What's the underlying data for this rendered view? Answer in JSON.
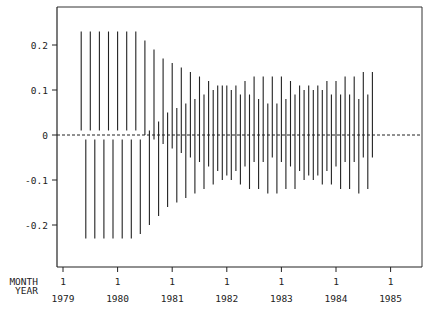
{
  "chart_data": {
    "type": "interval",
    "title": "",
    "xlabel": "",
    "ylabel": "",
    "ylim": [
      -0.28,
      0.28
    ],
    "yticks": [
      0.2,
      0.1,
      0,
      -0.1,
      -0.2
    ],
    "ytick_labels": [
      "0.2",
      "0.1",
      "0",
      "-0.1",
      "-0.2"
    ],
    "x_axis_rows": [
      {
        "label": "MONTH",
        "values": [
          "1",
          "1",
          "1",
          "1",
          "1",
          "1",
          "1"
        ]
      },
      {
        "label": "YEAR",
        "values": [
          "1979",
          "1980",
          "1981",
          "1982",
          "1983",
          "1984",
          "1985"
        ]
      }
    ],
    "reference_line": {
      "y": 0,
      "style": "dashed"
    },
    "grid": false,
    "start_month_index": 4,
    "intervals": [
      [
        0.01,
        0.23
      ],
      [
        -0.23,
        -0.01
      ],
      [
        0.01,
        0.23
      ],
      [
        -0.23,
        -0.01
      ],
      [
        0.01,
        0.23
      ],
      [
        -0.23,
        -0.01
      ],
      [
        0.01,
        0.23
      ],
      [
        -0.23,
        -0.01
      ],
      [
        0.01,
        0.23
      ],
      [
        -0.23,
        -0.01
      ],
      [
        0.01,
        0.23
      ],
      [
        -0.23,
        -0.01
      ],
      [
        0.01,
        0.23
      ],
      [
        -0.22,
        -0.01
      ],
      [
        0.0,
        0.21
      ],
      [
        -0.2,
        0.01
      ],
      [
        -0.01,
        0.19
      ],
      [
        -0.18,
        0.03
      ],
      [
        -0.02,
        0.17
      ],
      [
        -0.16,
        0.05
      ],
      [
        -0.03,
        0.16
      ],
      [
        -0.15,
        0.06
      ],
      [
        -0.04,
        0.15
      ],
      [
        -0.14,
        0.07
      ],
      [
        -0.05,
        0.14
      ],
      [
        -0.13,
        0.08
      ],
      [
        -0.06,
        0.13
      ],
      [
        -0.12,
        0.09
      ],
      [
        -0.07,
        0.12
      ],
      [
        -0.11,
        0.1
      ],
      [
        -0.08,
        0.11
      ],
      [
        -0.1,
        0.11
      ],
      [
        -0.09,
        0.11
      ],
      [
        -0.1,
        0.1
      ],
      [
        -0.08,
        0.11
      ],
      [
        -0.11,
        0.09
      ],
      [
        -0.07,
        0.12
      ],
      [
        -0.12,
        0.09
      ],
      [
        -0.06,
        0.13
      ],
      [
        -0.12,
        0.08
      ],
      [
        -0.06,
        0.13
      ],
      [
        -0.13,
        0.07
      ],
      [
        -0.05,
        0.13
      ],
      [
        -0.13,
        0.07
      ],
      [
        -0.06,
        0.13
      ],
      [
        -0.12,
        0.08
      ],
      [
        -0.07,
        0.12
      ],
      [
        -0.12,
        0.09
      ],
      [
        -0.08,
        0.11
      ],
      [
        -0.1,
        0.1
      ],
      [
        -0.09,
        0.11
      ],
      [
        -0.1,
        0.1
      ],
      [
        -0.09,
        0.11
      ],
      [
        -0.11,
        0.1
      ],
      [
        -0.08,
        0.12
      ],
      [
        -0.11,
        0.09
      ],
      [
        -0.07,
        0.12
      ],
      [
        -0.12,
        0.09
      ],
      [
        -0.06,
        0.13
      ],
      [
        -0.12,
        0.09
      ],
      [
        -0.06,
        0.13
      ],
      [
        -0.13,
        0.08
      ],
      [
        -0.05,
        0.14
      ],
      [
        -0.12,
        0.09
      ],
      [
        -0.05,
        0.14
      ]
    ]
  }
}
